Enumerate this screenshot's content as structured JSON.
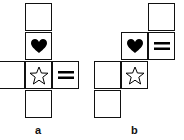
{
  "figures": [
    {
      "label": "a",
      "faces": [
        "blank",
        "heart",
        "blank",
        "star",
        "equals",
        "blank"
      ]
    },
    {
      "label": "b",
      "faces": [
        "blank",
        "heart",
        "equals",
        "blank",
        "star",
        "blank"
      ]
    }
  ],
  "colors": {
    "line": "#111111",
    "fill": "#000000"
  }
}
